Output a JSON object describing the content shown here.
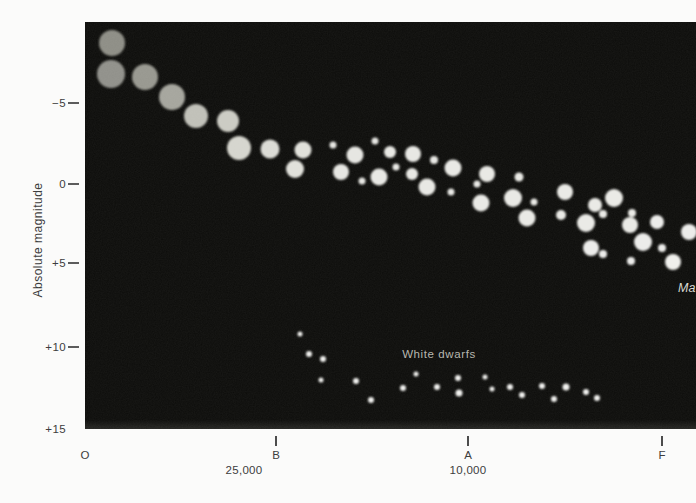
{
  "figure": {
    "width": 696,
    "height": 503,
    "plot": {
      "left": 85,
      "top": 22,
      "width": 611,
      "height": 407,
      "background": "#0c0c0a"
    },
    "page_background": "#fbfbfa"
  },
  "y_axis": {
    "title": "Absolute magnitude",
    "label_right_edge_px": 66,
    "tick_x_px": 68,
    "tick_len_px": 11,
    "title_center": {
      "x": 38,
      "y": 240
    },
    "ticks": [
      {
        "label": "−5",
        "y": 103,
        "show_tick": true
      },
      {
        "label": "0",
        "y": 184,
        "show_tick": true
      },
      {
        "label": "+5",
        "y": 263,
        "show_tick": true
      },
      {
        "label": "+10",
        "y": 347,
        "show_tick": true
      },
      {
        "label": "+15",
        "y": 429,
        "show_tick": false
      }
    ]
  },
  "x_axis": {
    "tick_top_px": 436,
    "tick_len_px": 10,
    "class_label_top_px": 449,
    "temp_label_top_px": 464,
    "classes": [
      {
        "label": "O",
        "x": 85,
        "show_tick": false
      },
      {
        "label": "B",
        "x": 276,
        "show_tick": true
      },
      {
        "label": "A",
        "x": 468,
        "show_tick": true
      },
      {
        "label": "F",
        "x": 662,
        "show_tick": true
      }
    ],
    "temperatures": [
      {
        "label": "25,000",
        "x": 244
      },
      {
        "label": "10,000",
        "x": 468
      }
    ]
  },
  "annotations": {
    "white_dwarfs": {
      "text": "White dwarfs",
      "x": 439,
      "y": 354,
      "color": "#b7b7af"
    },
    "main_sequence_partial": {
      "text": "Ma",
      "x": 678,
      "y": 281,
      "color": "#d8d8cf",
      "note": "clipped at right edge of image"
    }
  },
  "chart_data": {
    "type": "scatter",
    "xlabel": "Spectral class (O, B, A, F) / Temperature (K)",
    "ylabel": "Absolute magnitude",
    "ylim": [
      15,
      -10
    ],
    "grid": false,
    "legend": false,
    "x_tick_labels": [
      "O",
      "B",
      "A",
      "F"
    ],
    "temperature_tick_labels": [
      "25,000",
      "10,000"
    ],
    "calibration": {
      "units": "pixel coordinates in the 696×503 image",
      "magnitude_0_at_y_px": 184,
      "px_per_magnitude": 16.3,
      "spectral_class_x_px": {
        "O": 85,
        "B": 276,
        "A": 468,
        "F": 662
      },
      "temperature_x_px": {
        "25000": 244,
        "10000": 468
      }
    },
    "series": [
      {
        "name": "Main sequence",
        "point_format": [
          "x_px",
          "y_px",
          "radius_px",
          "fill"
        ],
        "points": [
          [
            112,
            43,
            13,
            "#8d8d85"
          ],
          [
            111,
            74,
            14,
            "#90908a"
          ],
          [
            145,
            77,
            13,
            "#97978f"
          ],
          [
            172,
            97,
            13,
            "#a5a59d"
          ],
          [
            196,
            116,
            12,
            "#c0c0b8"
          ],
          [
            228,
            121,
            11,
            "#cbcbc3"
          ],
          [
            239,
            148,
            12,
            "#d5d5ce"
          ],
          [
            270,
            149,
            9.5,
            "#dbdbd5"
          ],
          [
            303,
            150,
            8.5,
            "#e1e1db"
          ],
          [
            295,
            169,
            9,
            "#e1e1db"
          ],
          [
            333,
            145,
            3.5,
            "#e6e6e2"
          ],
          [
            355,
            155,
            8.5,
            "#e6e6e2"
          ],
          [
            341,
            172,
            8,
            "#e6e6e2"
          ],
          [
            362,
            181,
            3.5,
            "#e6e6e2"
          ],
          [
            375,
            141,
            3.5,
            "#e6e6e2"
          ],
          [
            390,
            152,
            6,
            "#e8e8e4"
          ],
          [
            396,
            167,
            3.5,
            "#e8e8e4"
          ],
          [
            379,
            177,
            8.5,
            "#e8e8e4"
          ],
          [
            413,
            154,
            8,
            "#e8e8e4"
          ],
          [
            412,
            174,
            6,
            "#e8e8e4"
          ],
          [
            434,
            160,
            4,
            "#e8e8e4"
          ],
          [
            427,
            187,
            8.5,
            "#e8e8e4"
          ],
          [
            453,
            168,
            8.5,
            "#e9e9e5"
          ],
          [
            451,
            192,
            3.5,
            "#e9e9e5"
          ],
          [
            487,
            174,
            8,
            "#e9e9e5"
          ],
          [
            477,
            184,
            3.5,
            "#e9e9e5"
          ],
          [
            481,
            203,
            8.5,
            "#e9e9e5"
          ],
          [
            519,
            177,
            4.5,
            "#e9e9e5"
          ],
          [
            513,
            198,
            9,
            "#e9e9e5"
          ],
          [
            534,
            202,
            3.5,
            "#e9e9e5"
          ],
          [
            527,
            218,
            8.5,
            "#e9e9e5"
          ],
          [
            565,
            192,
            8,
            "#eaeae6"
          ],
          [
            561,
            215,
            5,
            "#eaeae6"
          ],
          [
            595,
            205,
            7,
            "#eaeae6"
          ],
          [
            614,
            198,
            9,
            "#eaeae6"
          ],
          [
            586,
            223,
            9,
            "#eaeae6"
          ],
          [
            603,
            214,
            4,
            "#eaeae6"
          ],
          [
            632,
            213,
            4,
            "#eaeae6"
          ],
          [
            630,
            225,
            8,
            "#eaeae6"
          ],
          [
            591,
            248,
            8,
            "#ececea"
          ],
          [
            603,
            254,
            4,
            "#ececea"
          ],
          [
            643,
            242,
            9,
            "#ececea"
          ],
          [
            657,
            222,
            7,
            "#ececea"
          ],
          [
            662,
            248,
            4,
            "#ececea"
          ],
          [
            689,
            232,
            8,
            "#ececea"
          ],
          [
            673,
            262,
            8,
            "#efefec"
          ],
          [
            631,
            261,
            4,
            "#ececea"
          ]
        ]
      },
      {
        "name": "White dwarfs",
        "fill": "#f2f2ef",
        "point_format": [
          "x_px",
          "y_px",
          "radius_px"
        ],
        "points": [
          [
            300,
            334,
            2.5
          ],
          [
            309,
            354,
            3
          ],
          [
            323,
            359,
            3
          ],
          [
            321,
            380,
            2.5
          ],
          [
            356,
            381,
            3
          ],
          [
            371,
            400,
            3
          ],
          [
            403,
            388,
            3
          ],
          [
            416,
            374,
            2.5
          ],
          [
            437,
            387,
            3
          ],
          [
            458,
            378,
            3
          ],
          [
            459,
            393,
            3.5
          ],
          [
            485,
            377,
            2.5
          ],
          [
            492,
            389,
            2.5
          ],
          [
            510,
            387,
            3
          ],
          [
            522,
            395,
            3
          ],
          [
            542,
            386,
            3
          ],
          [
            554,
            399,
            3
          ],
          [
            566,
            387,
            3.5
          ],
          [
            586,
            392,
            3
          ],
          [
            597,
            398,
            3
          ]
        ]
      }
    ]
  }
}
